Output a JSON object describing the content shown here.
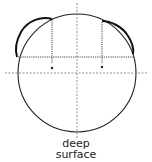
{
  "diagram": {
    "type": "cross-section schematic",
    "label_line1": "deep",
    "label_line2": "surface",
    "colors": {
      "stroke": "#222222",
      "dotted": "#555555",
      "background": "#ffffff"
    },
    "elements": [
      "circle outline",
      "vertical dashed center axis",
      "horizontal dashed center axis",
      "horizontal dotted chord line",
      "two vertical dotted drop lines with end dots",
      "two thick bulging arcs on upper left and upper right"
    ]
  }
}
